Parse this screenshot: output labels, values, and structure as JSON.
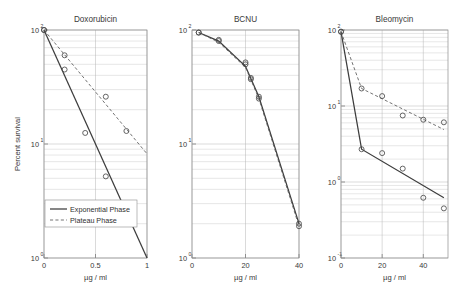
{
  "figure": {
    "y_axis_label": "Percent survival",
    "x_axis_label": "µg / ml",
    "legend": {
      "exponential": "Exponential Phase",
      "plateau": "Plateau Phase"
    },
    "colors": {
      "exponential_line": "#3d3d3d",
      "plateau_line": "#5a5a5a",
      "marker": "#4a4a4a",
      "axis": "#8d8d8d",
      "grid": "#c9c9c9",
      "text": "#3a3a3a",
      "background": "#ffffff"
    }
  },
  "chart_data": [
    {
      "type": "line",
      "title": "Doxorubicin",
      "xlabel": "µg / ml",
      "ylabel": "Percent survival",
      "yscale": "log",
      "xlim": [
        0,
        1
      ],
      "ylim": [
        1,
        100
      ],
      "xticks": [
        0,
        0.5,
        1
      ],
      "xticklabels": [
        "0",
        "0.5",
        "1"
      ],
      "yticks": [
        1,
        10,
        100
      ],
      "yticklabels": [
        "10^0",
        "10^1",
        "10^2"
      ],
      "grid": true,
      "legend_position": "lower left",
      "series": [
        {
          "name": "Exponential Phase",
          "style": "solid",
          "marker": "o",
          "x": [
            0,
            0.2,
            0.4,
            0.6
          ],
          "y": [
            100,
            45,
            12.5,
            5.2
          ],
          "fit_x": [
            0,
            1
          ],
          "fit_y": [
            100,
            1.0
          ]
        },
        {
          "name": "Plateau Phase",
          "style": "dashed",
          "marker": "o",
          "x": [
            0,
            0.2,
            0.6,
            0.8
          ],
          "y": [
            100,
            60,
            26,
            13
          ],
          "fit_x": [
            0,
            1
          ],
          "fit_y": [
            100,
            8.2
          ]
        }
      ]
    },
    {
      "type": "line",
      "title": "BCNU",
      "xlabel": "µg / ml",
      "ylabel": "",
      "yscale": "log",
      "xlim": [
        0,
        40
      ],
      "ylim": [
        1,
        100
      ],
      "xticks": [
        0,
        20,
        40
      ],
      "xticklabels": [
        "0",
        "20",
        "40"
      ],
      "yticks": [
        1,
        10,
        100
      ],
      "yticklabels": [
        "10^0",
        "10^1",
        "10^2"
      ],
      "grid": true,
      "legend_position": "none",
      "series": [
        {
          "name": "Exponential Phase",
          "style": "solid",
          "marker": "o",
          "x": [
            2.5,
            10,
            20,
            22,
            25,
            40
          ],
          "y": [
            95,
            82,
            52,
            38,
            26,
            2.0
          ],
          "fit_x": [
            2.5,
            10,
            20,
            25,
            40
          ],
          "fit_y": [
            95,
            80,
            48,
            26,
            2.0
          ]
        },
        {
          "name": "Plateau Phase",
          "style": "dashed",
          "marker": "o",
          "x": [
            2.5,
            10,
            20,
            22,
            25,
            40
          ],
          "y": [
            95,
            80,
            50,
            37,
            25,
            1.9
          ],
          "fit_x": [
            2.5,
            10,
            20,
            25,
            40
          ],
          "fit_y": [
            95,
            78,
            47,
            25,
            1.9
          ]
        }
      ]
    },
    {
      "type": "line",
      "title": "Bleomycin",
      "xlabel": "µg / ml",
      "ylabel": "",
      "yscale": "log",
      "xlim": [
        0,
        52
      ],
      "ylim": [
        0.1,
        100
      ],
      "xticks": [
        0,
        20,
        40
      ],
      "xticklabels": [
        "0",
        "20",
        "40"
      ],
      "yticks": [
        0.1,
        1,
        10,
        100
      ],
      "yticklabels": [
        "10^-1",
        "10^0",
        "10^1",
        "10^2"
      ],
      "grid": true,
      "legend_position": "none",
      "series": [
        {
          "name": "Exponential Phase",
          "style": "solid",
          "marker": "o",
          "x": [
            0,
            10,
            20,
            30,
            40,
            50
          ],
          "y": [
            95,
            2.7,
            2.4,
            1.5,
            0.62,
            0.45
          ],
          "fit_x": [
            0,
            10,
            50
          ],
          "fit_y": [
            95,
            2.7,
            0.62
          ]
        },
        {
          "name": "Plateau Phase",
          "style": "dashed",
          "marker": "o",
          "x": [
            0,
            10,
            20,
            30,
            40,
            50
          ],
          "y": [
            95,
            17,
            13.5,
            7.5,
            6.6,
            6.1
          ],
          "fit_x": [
            0,
            10,
            50
          ],
          "fit_y": [
            95,
            17,
            4.9
          ]
        }
      ]
    }
  ]
}
